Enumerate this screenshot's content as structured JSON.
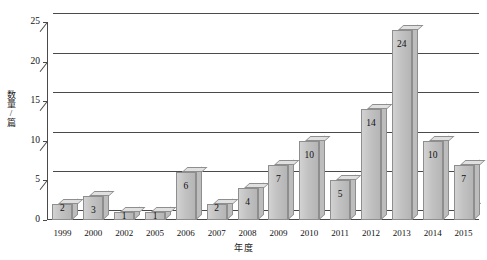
{
  "chart_data": {
    "type": "bar",
    "title": "",
    "subtitle": "",
    "xlabel": "年度",
    "ylabel": "数量/篇",
    "categories": [
      "1999",
      "2000",
      "2002",
      "2005",
      "2006",
      "2007",
      "2008",
      "2009",
      "2010",
      "2011",
      "2012",
      "2013",
      "2014",
      "2015"
    ],
    "values": [
      2,
      3,
      1,
      1,
      6,
      2,
      4,
      7,
      10,
      5,
      14,
      24,
      10,
      7
    ],
    "data_labels": [
      "2",
      "3",
      "1",
      "1",
      "6",
      "2",
      "4",
      "7",
      "10",
      "5",
      "14",
      "24",
      "10",
      "7"
    ],
    "ylim": [
      0,
      25
    ],
    "yticks": [
      0,
      5,
      10,
      15,
      20,
      25
    ],
    "ytick_labels": [
      "0",
      "5",
      "10",
      "15",
      "20",
      "25"
    ],
    "grid": true,
    "grid_axis": "y",
    "legend": false,
    "legend_position": "none",
    "style": "3d-column",
    "bar_color": "#c2c2c2",
    "bar_edge_color": "#8e8e8e",
    "axis_color": "#4a4a4a",
    "text_color": "#111111",
    "background": "#ffffff"
  }
}
